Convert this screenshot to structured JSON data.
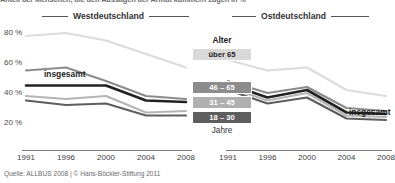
{
  "title_cut": "Anteil der Menschen, die den Aussagen der Armut kümmern  zugen in %",
  "regions": {
    "west": "Westdeutschland",
    "east": "Ostdeutschland"
  },
  "axis": {
    "y_ticks": [
      "80 %",
      "60 %",
      "40 %",
      "20 %"
    ],
    "x_ticks": [
      "1991",
      "1996",
      "2000",
      "2004",
      "2008"
    ]
  },
  "legend": {
    "title": "Alter",
    "footer": "Jahre",
    "items": [
      {
        "label": "über 65",
        "color": "#d9d9d9",
        "text_color": "#1d1d1d"
      },
      {
        "label": "46 – 65",
        "color": "#8c8c8c",
        "text_color": "#ffffff"
      },
      {
        "label": "31 – 45",
        "color": "#b0b0b0",
        "text_color": "#ffffff"
      },
      {
        "label": "18 – 30",
        "color": "#5e5e5e",
        "text_color": "#ffffff"
      }
    ]
  },
  "inline_labels": {
    "insgesamt_west": "insgesamt",
    "insgesamt_east": "insgesamt"
  },
  "source": "Quelle: ALLBUS 2008 | © Hans-Böckler-Stiftung 2011",
  "colors": {
    "ueber65": "#dcdcdc",
    "46_65": "#8c8c8c",
    "insgesamt": "#222222",
    "31_45": "#b5b5b5",
    "18_30": "#5e5e5e",
    "axis": "#7a7a7a",
    "background": "#ffffff"
  },
  "chart_data": {
    "type": "line",
    "title": "Anteil der Menschen, die den Aussagen der Armut kümmern  zugen in %",
    "xlabel": "",
    "ylabel": "%",
    "x": [
      "1991",
      "1996",
      "2000",
      "2004",
      "2008"
    ],
    "ylim": [
      10,
      90
    ],
    "yticks": [
      20,
      40,
      60,
      80
    ],
    "grid": false,
    "legend_position": "center",
    "panels": [
      {
        "name": "Westdeutschland",
        "series": [
          {
            "name": "über 65",
            "color": "#dcdcdc",
            "values": [
              78,
              80,
              75,
              66,
              57
            ]
          },
          {
            "name": "46 – 65",
            "color": "#8c8c8c",
            "values": [
              55,
              57,
              48,
              38,
              36
            ]
          },
          {
            "name": "insgesamt",
            "color": "#222222",
            "values": [
              45,
              45,
              45,
              35,
              34
            ]
          },
          {
            "name": "31 – 45",
            "color": "#b5b5b5",
            "values": [
              38,
              36,
              38,
              27,
              28
            ]
          },
          {
            "name": "18 – 30",
            "color": "#5e5e5e",
            "values": [
              35,
              32,
              33,
              25,
              25
            ]
          }
        ]
      },
      {
        "name": "Ostdeutschland",
        "series": [
          {
            "name": "über 65",
            "color": "#dcdcdc",
            "values": [
              62,
              55,
              57,
              42,
              38
            ]
          },
          {
            "name": "46 – 65",
            "color": "#8c8c8c",
            "values": [
              48,
              40,
              44,
              30,
              28
            ]
          },
          {
            "name": "insgesamt",
            "color": "#222222",
            "values": [
              46,
              37,
              42,
              27,
              26
            ]
          },
          {
            "name": "31 – 45",
            "color": "#b5b5b5",
            "values": [
              44,
              35,
              40,
              25,
              24
            ]
          },
          {
            "name": "18 – 30",
            "color": "#5e5e5e",
            "values": [
              42,
              33,
              37,
              23,
              22
            ]
          }
        ]
      }
    ]
  }
}
